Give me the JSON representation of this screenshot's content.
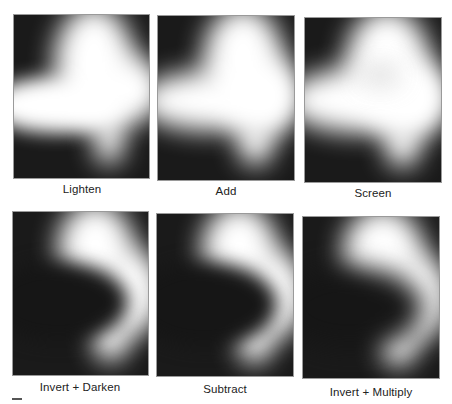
{
  "figure": {
    "panels": [
      {
        "id": "lighten",
        "label": "Lighten"
      },
      {
        "id": "add",
        "label": "Add"
      },
      {
        "id": "screen",
        "label": "Screen"
      },
      {
        "id": "invert-darken",
        "label": "Invert + Darken"
      },
      {
        "id": "subtract",
        "label": "Subtract"
      },
      {
        "id": "invert-multiply",
        "label": "Invert + Multiply"
      }
    ],
    "colors": {
      "background": "#ffffff",
      "panel_dark": "#1a1a1a",
      "highlight": "#ffffff",
      "label_text": "#222222"
    }
  }
}
